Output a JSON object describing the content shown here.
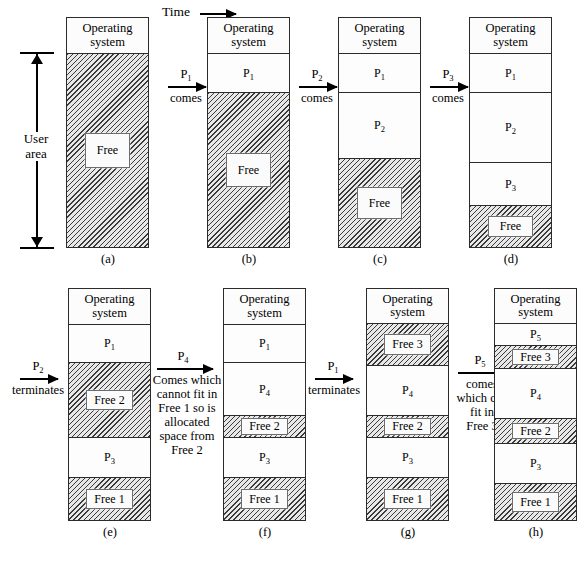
{
  "figure": {
    "time_axis": {
      "label": "Time"
    },
    "user_area": {
      "label": "User\narea",
      "line1": "User",
      "line2": "area"
    },
    "os_label": {
      "line1": "Operating",
      "line2": "system"
    }
  },
  "panels": [
    {
      "id": "a",
      "caption": "(a)",
      "segments": [
        {
          "name": "os",
          "label_line1": "Operating",
          "label_line2": "system",
          "free": false
        },
        {
          "name": "free",
          "label": "Free",
          "free": true
        }
      ]
    },
    {
      "id": "b",
      "caption": "(b)",
      "segments": [
        {
          "name": "os",
          "label_line1": "Operating",
          "label_line2": "system",
          "free": false
        },
        {
          "name": "p1",
          "label": "P1",
          "free": false
        },
        {
          "name": "free",
          "label": "Free",
          "free": true
        }
      ]
    },
    {
      "id": "c",
      "caption": "(c)",
      "segments": [
        {
          "name": "os",
          "label_line1": "Operating",
          "label_line2": "system",
          "free": false
        },
        {
          "name": "p1",
          "label": "P1",
          "free": false
        },
        {
          "name": "p2",
          "label": "P2",
          "free": false
        },
        {
          "name": "free",
          "label": "Free",
          "free": true
        }
      ]
    },
    {
      "id": "d",
      "caption": "(d)",
      "segments": [
        {
          "name": "os",
          "label_line1": "Operating",
          "label_line2": "system",
          "free": false
        },
        {
          "name": "p1",
          "label": "P1",
          "free": false
        },
        {
          "name": "p2",
          "label": "P2",
          "free": false
        },
        {
          "name": "p3",
          "label": "P3",
          "free": false
        },
        {
          "name": "free",
          "label": "Free",
          "free": true
        }
      ]
    },
    {
      "id": "e",
      "caption": "(e)",
      "segments": [
        {
          "name": "os",
          "label_line1": "Operating",
          "label_line2": "system",
          "free": false
        },
        {
          "name": "p1",
          "label": "P1",
          "free": false
        },
        {
          "name": "free2",
          "label": "Free 2",
          "free": true
        },
        {
          "name": "p3",
          "label": "P3",
          "free": false
        },
        {
          "name": "free1",
          "label": "Free 1",
          "free": true
        }
      ]
    },
    {
      "id": "f",
      "caption": "(f)",
      "segments": [
        {
          "name": "os",
          "label_line1": "Operating",
          "label_line2": "system",
          "free": false
        },
        {
          "name": "p1",
          "label": "P1",
          "free": false
        },
        {
          "name": "p4",
          "label": "P4",
          "free": false
        },
        {
          "name": "free2",
          "label": "Free 2",
          "free": true
        },
        {
          "name": "p3",
          "label": "P3",
          "free": false
        },
        {
          "name": "free1",
          "label": "Free 1",
          "free": true
        }
      ]
    },
    {
      "id": "g",
      "caption": "(g)",
      "segments": [
        {
          "name": "os",
          "label_line1": "Operating",
          "label_line2": "system",
          "free": false
        },
        {
          "name": "free3",
          "label": "Free 3",
          "free": true
        },
        {
          "name": "p4",
          "label": "P4",
          "free": false
        },
        {
          "name": "free2",
          "label": "Free 2",
          "free": true
        },
        {
          "name": "p3",
          "label": "P3",
          "free": false
        },
        {
          "name": "free1",
          "label": "Free 1",
          "free": true
        }
      ]
    },
    {
      "id": "h",
      "caption": "(h)",
      "segments": [
        {
          "name": "os",
          "label_line1": "Operating",
          "label_line2": "system",
          "free": false
        },
        {
          "name": "p5",
          "label": "P5",
          "free": false
        },
        {
          "name": "free3",
          "label": "Free 3",
          "free": true
        },
        {
          "name": "p4",
          "label": "P4",
          "free": false
        },
        {
          "name": "free2",
          "label": "Free 2",
          "free": true
        },
        {
          "name": "p3",
          "label": "P3",
          "free": false
        },
        {
          "name": "free1",
          "label": "Free 1",
          "free": true
        }
      ]
    }
  ],
  "transitions": [
    {
      "id": "a-to-b",
      "top_label": "P1",
      "lines": [
        "comes"
      ]
    },
    {
      "id": "b-to-c",
      "top_label": "P2",
      "lines": [
        "comes"
      ]
    },
    {
      "id": "c-to-d",
      "top_label": "P3",
      "lines": [
        "comes"
      ]
    },
    {
      "id": "d-to-e",
      "top_label": "P2",
      "lines": [
        "terminates"
      ]
    },
    {
      "id": "e-to-f",
      "top_label": "P4",
      "lines": [
        "Comes which",
        "cannot fit in",
        "Free 1 so is",
        "allocated",
        "space from",
        "Free 2"
      ]
    },
    {
      "id": "f-to-g",
      "top_label": "P1",
      "lines": [
        "terminates"
      ]
    },
    {
      "id": "g-to-h",
      "top_label": "P5",
      "lines": [
        "comes",
        "which can",
        "fit in",
        "Free 3"
      ]
    }
  ]
}
